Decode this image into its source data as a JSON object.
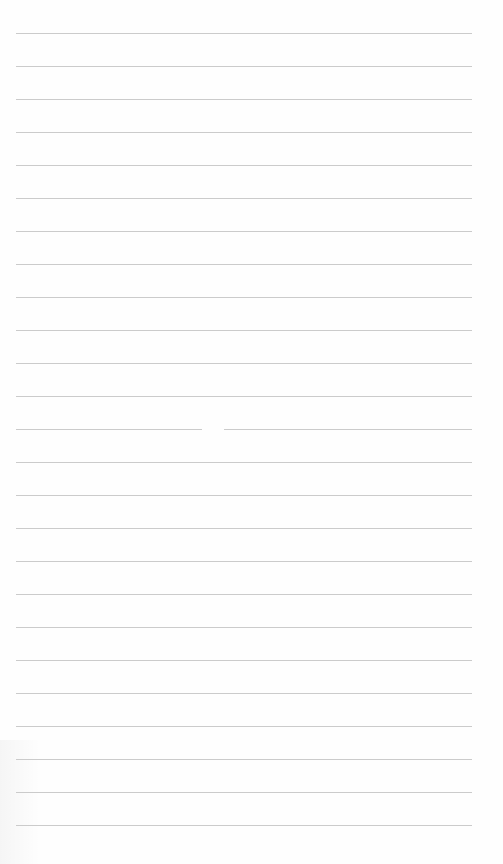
{
  "page": {
    "type": "lined-paper",
    "background_color": "#ffffff",
    "line_color": "#cbcbcb",
    "line_count": 25,
    "line_spacing_px": 33,
    "first_line_y": 33,
    "line_left_x": 16,
    "line_right_x": 472,
    "gap": {
      "line_index": 12,
      "from_x": 202,
      "to_x": 224
    },
    "text_lines": []
  }
}
